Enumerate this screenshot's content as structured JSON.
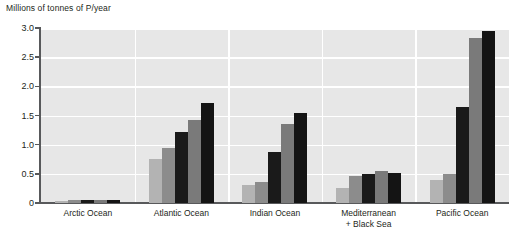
{
  "chart_data": {
    "type": "bar",
    "title": "Millions of tonnes of P/year",
    "xlabel": "",
    "ylabel": "Millions of tonnes of P/year",
    "ylim": [
      0,
      3.0
    ],
    "grid": true,
    "legend": "none",
    "y_ticks": [
      "0",
      "0.5",
      "1.0",
      "1.5",
      "2.0",
      "2.5",
      "3.0"
    ],
    "y_tick_values": [
      0,
      0.5,
      1.0,
      1.5,
      2.0,
      2.5,
      3.0
    ],
    "categories": [
      {
        "line1": "Arctic Ocean",
        "line2": ""
      },
      {
        "line1": "Atlantic Ocean",
        "line2": ""
      },
      {
        "line1": "Indian Ocean",
        "line2": ""
      },
      {
        "line1": "Mediterranean",
        "line2": "+ Black Sea"
      },
      {
        "line1": "Pacific Ocean",
        "line2": ""
      }
    ],
    "series": [
      {
        "name": "series-1",
        "color": "#b3b3b3",
        "values": [
          0.04,
          0.75,
          0.31,
          0.25,
          0.4
        ]
      },
      {
        "name": "series-2",
        "color": "#8c8c8c",
        "values": [
          0.05,
          0.95,
          0.36,
          0.47,
          0.5
        ]
      },
      {
        "name": "series-3",
        "color": "#1a1a1a",
        "values": [
          0.05,
          1.22,
          0.87,
          0.5,
          1.65
        ]
      },
      {
        "name": "series-4",
        "color": "#7a7a7a",
        "values": [
          0.05,
          1.42,
          1.35,
          0.55,
          2.83
        ]
      },
      {
        "name": "series-5",
        "color": "#141414",
        "values": [
          0.06,
          1.71,
          1.55,
          0.52,
          2.95
        ]
      }
    ],
    "colors": {
      "plot_background": "#e7e7e7",
      "gridline": "#ffffff",
      "axis": "#58595b",
      "text": "#231f20",
      "page_background": "#ffffff"
    }
  }
}
